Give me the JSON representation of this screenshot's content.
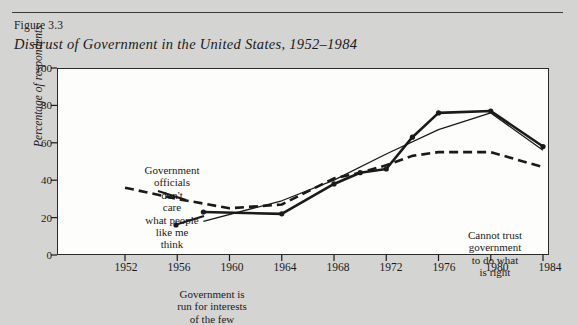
{
  "figure": {
    "number_label": "Figure 3.3",
    "title": "Distrust of Government in the United States, 1952–1984"
  },
  "chart_data": {
    "type": "line",
    "title": "Distrust of Government in the United States, 1952–1984",
    "xlabel": "",
    "ylabel": "Percentage of respondents",
    "xlim": [
      1952,
      1984
    ],
    "ylim": [
      0,
      100
    ],
    "grid": false,
    "legend_position": "none (inline annotations)",
    "x_ticks": [
      1952,
      1956,
      1960,
      1964,
      1968,
      1972,
      1976,
      1980,
      1984
    ],
    "y_ticks": [
      0,
      20,
      40,
      60,
      80,
      100
    ],
    "series": [
      {
        "name": "Government officials don't care what people like me think",
        "style": "dashed",
        "x": [
          1952,
          1956,
          1960,
          1964,
          1968,
          1970,
          1972,
          1974,
          1976,
          1980,
          1984
        ],
        "values": [
          36,
          30,
          25,
          27,
          41,
          44,
          48,
          53,
          55,
          55,
          47
        ]
      },
      {
        "name": "Cannot trust government to do what is right",
        "style": "solid-thick-markers",
        "x": [
          1958,
          1964,
          1968,
          1970,
          1972,
          1974,
          1976,
          1980,
          1984
        ],
        "values": [
          23,
          22,
          38,
          44,
          46,
          63,
          76,
          77,
          58
        ]
      },
      {
        "name": "Government is run for interests of the few",
        "style": "solid-thin",
        "x": [
          1958,
          1964,
          1968,
          1972,
          1976,
          1980,
          1984
        ],
        "values": [
          18,
          29,
          40,
          54,
          67,
          76,
          56
        ]
      }
    ],
    "annotations": [
      {
        "id": "officials",
        "text": "Government\nofficials\ndon't\ncare\nwhat people\nlike me\nthink",
        "points_to_series": "Government officials don't care what people like me think"
      },
      {
        "id": "interests",
        "text": "Government is\nrun for interests\nof the few",
        "points_to_series": "Government is run for interests of the few"
      },
      {
        "id": "trust",
        "text": "Cannot trust\ngovernment\nto do what\nis right",
        "points_to_series": "Cannot trust government to do what is right"
      }
    ]
  },
  "axis": {
    "y_tick_labels": [
      "100",
      "80",
      "60",
      "40",
      "20",
      "0"
    ],
    "x_tick_labels": [
      "1952",
      "1956",
      "1960",
      "1964",
      "1968",
      "1972",
      "1976",
      "1980",
      "1984"
    ],
    "y_axis_title": "Percentage of respondents"
  },
  "colors": {
    "page_background": "#d4d4d2",
    "plot_background": "#fdfdfb",
    "ink": "#1a1a1a",
    "rule": "#3a3a3a"
  }
}
